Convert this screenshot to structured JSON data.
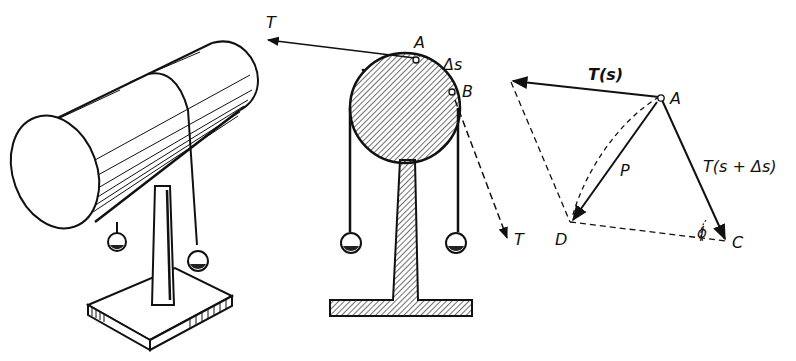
{
  "figure": {
    "panels": [
      {
        "id": "perspective",
        "description": "Horizontal cylinder on a pedestal stand with a string draped over it carrying two hanging weights"
      },
      {
        "id": "cross-section",
        "description": "Cross-section of cylinder with string over it, points A and B, arc segment delta s, tension arrows T"
      },
      {
        "id": "force-diagram",
        "description": "Force parallelogram at point A with T(s), T(s+delta s), resultant P, points D and C, angle phi"
      }
    ],
    "labels": {
      "tension_left": "T",
      "tension_right": "T",
      "point_a": "A",
      "point_b": "B",
      "arc_delta": "Δs",
      "force_ts": "T(s)",
      "force_ts_ds": "T(s + Δs)",
      "resultant": "P",
      "point_a2": "A",
      "point_d": "D",
      "point_c": "C",
      "angle": "ϕ"
    },
    "colors": {
      "ink": "#111111",
      "paper": "#ffffff"
    }
  }
}
